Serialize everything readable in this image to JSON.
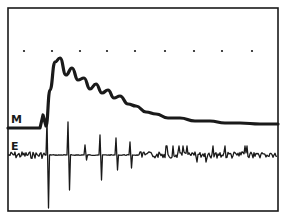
{
  "chart_data": {
    "type": "line",
    "title": "",
    "xlabel": "",
    "ylabel": "",
    "grid": false,
    "legend": [],
    "annotations": [
      {
        "text": "M",
        "meaning": "mechanical response trace",
        "position": "left, upper trace"
      },
      {
        "text": "E",
        "meaning": "electrical (EMG) trace",
        "position": "left, lower trace"
      }
    ],
    "reference_dots": {
      "count": 9,
      "y_px": 51,
      "x_px": [
        24,
        52,
        80,
        107,
        135,
        165,
        194,
        222,
        252
      ]
    },
    "series": [
      {
        "name": "M",
        "description": "Baseline, then steep rise to a peak followed by damped oscillating decay back toward a slightly elevated baseline",
        "x_px": [
          8,
          40,
          43,
          46,
          50,
          55,
          60,
          66,
          72,
          78,
          84,
          90,
          96,
          102,
          108,
          114,
          120,
          128,
          136,
          146,
          156,
          168,
          180,
          195,
          210,
          225,
          240,
          260,
          278
        ],
        "y_px": [
          128,
          128,
          115,
          126,
          90,
          62,
          58,
          75,
          68,
          80,
          78,
          89,
          84,
          93,
          90,
          98,
          96,
          104,
          106,
          112,
          114,
          118,
          118,
          121,
          121,
          123,
          123,
          124,
          124
        ]
      },
      {
        "name": "E",
        "description": "Noisy baseline, large biphasic spikes after stimulus, then small irregular activity",
        "baseline_y_px": 155,
        "spikes": [
          {
            "x_px": 47,
            "top_y": 120,
            "bottom_y": 208
          },
          {
            "x_px": 68,
            "top_y": 122,
            "bottom_y": 190
          },
          {
            "x_px": 85,
            "top_y": 145,
            "bottom_y": 160
          },
          {
            "x_px": 100,
            "top_y": 135,
            "bottom_y": 180
          },
          {
            "x_px": 116,
            "top_y": 138,
            "bottom_y": 170
          },
          {
            "x_px": 130,
            "top_y": 142,
            "bottom_y": 168
          }
        ]
      }
    ],
    "frame": {
      "left": 8,
      "top": 8,
      "right": 278,
      "bottom": 211
    }
  },
  "labels": {
    "m": "M",
    "e": "E"
  },
  "colors": {
    "ink": "#1a1a1a",
    "background": "#ffffff"
  }
}
